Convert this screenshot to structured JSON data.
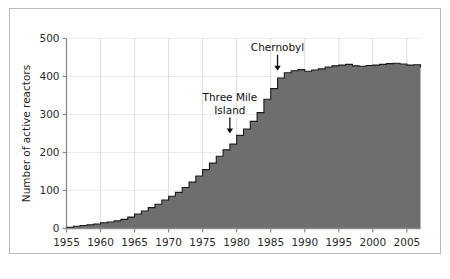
{
  "chart_data": {
    "type": "area",
    "title": "",
    "subtitle": "",
    "xlabel": "",
    "ylabel": "Number of active reactors",
    "xlim": [
      1955,
      2007
    ],
    "ylim": [
      0,
      500
    ],
    "grid": true,
    "legend": null,
    "step_style": "post",
    "fill_color": "#6e6e6e",
    "line_color": "#1a1a1a",
    "grid_color": "#dcdcdc",
    "axis_color": "#8a8a8a",
    "xticks": [
      1955,
      1960,
      1965,
      1970,
      1975,
      1980,
      1985,
      1990,
      1995,
      2000,
      2005
    ],
    "xtick_labels": [
      "1955",
      "1960",
      "1965",
      "1970",
      "1975",
      "1980",
      "1985",
      "1990",
      "1995",
      "2000",
      "2005"
    ],
    "yticks": [
      0,
      100,
      200,
      300,
      400,
      500
    ],
    "ytick_labels": [
      "0",
      "100",
      "200",
      "300",
      "400",
      "500"
    ],
    "x": [
      1955,
      1956,
      1957,
      1958,
      1959,
      1960,
      1961,
      1962,
      1963,
      1964,
      1965,
      1966,
      1967,
      1968,
      1969,
      1970,
      1971,
      1972,
      1973,
      1974,
      1975,
      1976,
      1977,
      1978,
      1979,
      1980,
      1981,
      1982,
      1983,
      1984,
      1985,
      1986,
      1987,
      1988,
      1989,
      1990,
      1991,
      1992,
      1993,
      1994,
      1995,
      1996,
      1997,
      1998,
      1999,
      2000,
      2001,
      2002,
      2003,
      2004,
      2005,
      2006,
      2007
    ],
    "values": [
      3,
      6,
      8,
      10,
      12,
      15,
      17,
      20,
      24,
      30,
      38,
      46,
      55,
      64,
      75,
      85,
      95,
      108,
      122,
      138,
      155,
      172,
      190,
      207,
      222,
      245,
      262,
      282,
      305,
      340,
      368,
      396,
      410,
      415,
      418,
      414,
      417,
      420,
      425,
      428,
      430,
      432,
      428,
      427,
      429,
      430,
      432,
      434,
      435,
      433,
      430,
      431,
      424
    ],
    "annotations": [
      {
        "text": "Three Mile Island",
        "lines": [
          "Three Mile",
          "Island"
        ],
        "x": 1979,
        "y": 250,
        "arrow": "down-arrow"
      },
      {
        "text": "Chernobyl",
        "lines": [
          "Chernobyl"
        ],
        "x": 1986,
        "y": 415,
        "arrow": "down-arrow"
      }
    ]
  }
}
